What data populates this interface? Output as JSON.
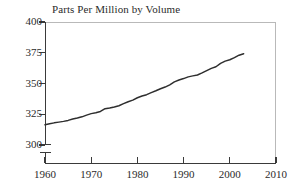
{
  "chart_data": {
    "type": "line",
    "title": "Parts Per Million by Volume",
    "xlabel": "",
    "ylabel": "",
    "xlim": [
      1960,
      2010
    ],
    "ylim": [
      300,
      400
    ],
    "grid": false,
    "legend": null,
    "y_axis_break": true,
    "y_ticks": [
      300,
      325,
      350,
      375,
      400
    ],
    "y_tick_labels": [
      "300",
      "325",
      "350",
      "375",
      "400"
    ],
    "x_ticks": [
      1960,
      1970,
      1980,
      1990,
      2000,
      2010
    ],
    "x_tick_labels": [
      "1960",
      "1970",
      "1980",
      "1990",
      "2000",
      "2010"
    ],
    "series": [
      {
        "name": "Parts Per Million by Volume",
        "color": "#2e2e2e",
        "x": [
          1960,
          1961,
          1962,
          1963,
          1964,
          1965,
          1966,
          1967,
          1968,
          1969,
          1970,
          1971,
          1972,
          1973,
          1974,
          1975,
          1976,
          1977,
          1978,
          1979,
          1980,
          1981,
          1982,
          1983,
          1984,
          1985,
          1986,
          1987,
          1988,
          1989,
          1990,
          1991,
          1992,
          1993,
          1994,
          1995,
          1996,
          1997,
          1998,
          1999,
          2000,
          2001,
          2002,
          2003
        ],
        "values": [
          316.4,
          317.2,
          318.0,
          318.6,
          319.2,
          320.0,
          321.1,
          321.9,
          322.9,
          324.3,
          325.5,
          326.2,
          327.3,
          329.5,
          330.0,
          330.9,
          331.9,
          333.6,
          335.2,
          336.5,
          338.4,
          339.8,
          340.9,
          342.6,
          344.1,
          345.7,
          347.1,
          348.9,
          351.3,
          352.8,
          354.0,
          355.4,
          356.2,
          356.9,
          358.6,
          360.5,
          362.3,
          363.6,
          366.4,
          368.2,
          369.3,
          371.0,
          373.0,
          374.2
        ]
      }
    ]
  }
}
